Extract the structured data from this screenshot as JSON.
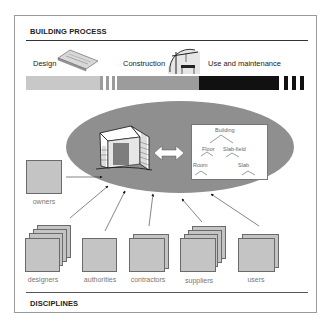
{
  "header": {
    "title": "BUILDING PROCESS"
  },
  "footer": {
    "title": "DISCIPLINES"
  },
  "phases": [
    {
      "label": "Design",
      "icon": "blueprint-icon",
      "color": "#c8c8c8"
    },
    {
      "label": "Construction",
      "icon": "crane-icon",
      "color": "#9c9c9c"
    },
    {
      "label": "Use and maintenance",
      "icon": "",
      "color": "#111111"
    }
  ],
  "model": {
    "building_icon": "building-icon",
    "link_icon": "double-arrow-icon",
    "tree": {
      "root": "Building",
      "level1": [
        "Floor",
        "Slab-field"
      ],
      "level2": [
        "Room",
        "Slab"
      ]
    }
  },
  "disciplines": [
    {
      "label": "owners",
      "stack": 1
    },
    {
      "label": "designers",
      "stack": 4
    },
    {
      "label": "authorities",
      "stack": 1
    },
    {
      "label": "contractors",
      "stack": 2
    },
    {
      "label": "suppliers",
      "stack": 4
    },
    {
      "label": "users",
      "stack": 2
    }
  ],
  "colors": {
    "design": "#c8c8c8",
    "construction": "#9c9c9c",
    "use": "#111111",
    "ellipse": "#8f8f8f",
    "card": "#c4c4c4"
  }
}
